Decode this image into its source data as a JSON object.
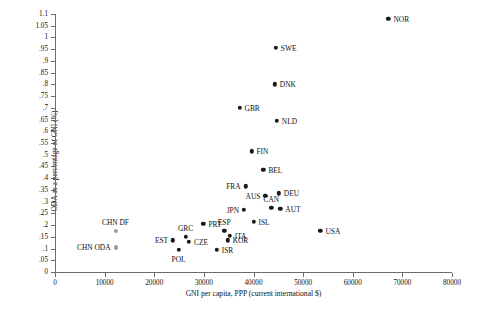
{
  "chart_data": {
    "type": "scatter",
    "title": "",
    "xlabel": "GNI per capita, PPP (current international $)",
    "ylabel": "ODA as a percentage of GNI (%)",
    "xlim": [
      0,
      80000
    ],
    "ylim": [
      0,
      1.1
    ],
    "grid": false,
    "legend": "none",
    "xticks": [
      "0",
      "10000",
      "20000",
      "30000",
      "40000",
      "50000",
      "60000",
      "70000",
      "80000"
    ],
    "xtick_values": [
      0,
      10000,
      20000,
      30000,
      40000,
      50000,
      60000,
      70000,
      80000
    ],
    "yticks": [
      "0",
      ".05",
      ".1",
      ".15",
      ".2",
      ".25",
      ".3",
      ".35",
      ".4",
      ".45",
      ".5",
      ".55",
      ".6",
      ".65",
      ".7",
      ".75",
      ".8",
      ".85",
      ".9",
      ".95",
      "1",
      "1.05",
      "1.1"
    ],
    "ytick_values": [
      0,
      0.05,
      0.1,
      0.15,
      0.2,
      0.25,
      0.3,
      0.35,
      0.4,
      0.45,
      0.5,
      0.55,
      0.6,
      0.65,
      0.7,
      0.75,
      0.8,
      0.85,
      0.9,
      0.95,
      1.0,
      1.05,
      1.1
    ],
    "point_color": "#1a1a1a",
    "secondary_point_color": "#9a9a9a",
    "points": [
      {
        "label": "NOR",
        "x": 67200,
        "y": 1.08,
        "pos": "r",
        "style": "dark"
      },
      {
        "label": "SWE",
        "x": 44500,
        "y": 0.955,
        "pos": "r",
        "style": "dark"
      },
      {
        "label": "DNK",
        "x": 44300,
        "y": 0.8,
        "pos": "r",
        "style": "dark"
      },
      {
        "label": "GBR",
        "x": 37200,
        "y": 0.7,
        "pos": "r",
        "style": "dark"
      },
      {
        "label": "NLD",
        "x": 44700,
        "y": 0.645,
        "pos": "r",
        "style": "dark"
      },
      {
        "label": "FIN",
        "x": 39600,
        "y": 0.515,
        "pos": "r",
        "style": "dark"
      },
      {
        "label": "BEL",
        "x": 42000,
        "y": 0.435,
        "pos": "r",
        "style": "dark"
      },
      {
        "label": "FRA",
        "x": 38400,
        "y": 0.365,
        "pos": "l",
        "style": "dark"
      },
      {
        "label": "DEU",
        "x": 45100,
        "y": 0.335,
        "pos": "r",
        "style": "dark"
      },
      {
        "label": "AUS",
        "x": 42400,
        "y": 0.325,
        "pos": "l",
        "style": "dark"
      },
      {
        "label": "CAN",
        "x": 43600,
        "y": 0.275,
        "pos": "t",
        "style": "dark"
      },
      {
        "label": "AUT",
        "x": 45400,
        "y": 0.27,
        "pos": "r",
        "style": "dark"
      },
      {
        "label": "JPN",
        "x": 38100,
        "y": 0.265,
        "pos": "l",
        "style": "dark"
      },
      {
        "label": "ISL",
        "x": 40000,
        "y": 0.215,
        "pos": "r",
        "style": "dark"
      },
      {
        "label": "USA",
        "x": 53500,
        "y": 0.175,
        "pos": "r",
        "style": "dark"
      },
      {
        "label": "PRT",
        "x": 29900,
        "y": 0.205,
        "pos": "r",
        "style": "dark"
      },
      {
        "label": "ESP",
        "x": 34100,
        "y": 0.175,
        "pos": "t",
        "style": "dark"
      },
      {
        "label": "ITA",
        "x": 35200,
        "y": 0.155,
        "pos": "r",
        "style": "dark"
      },
      {
        "label": "KOR",
        "x": 34800,
        "y": 0.135,
        "pos": "r",
        "style": "dark"
      },
      {
        "label": "GRC",
        "x": 26300,
        "y": 0.15,
        "pos": "t",
        "style": "dark"
      },
      {
        "label": "CZE",
        "x": 27000,
        "y": 0.13,
        "pos": "r",
        "style": "dark"
      },
      {
        "label": "EST",
        "x": 23800,
        "y": 0.135,
        "pos": "l",
        "style": "dark"
      },
      {
        "label": "POL",
        "x": 24900,
        "y": 0.095,
        "pos": "b",
        "style": "dark"
      },
      {
        "label": "ISR",
        "x": 32600,
        "y": 0.095,
        "pos": "r",
        "style": "dark"
      },
      {
        "label": "CHN DF",
        "x": 12200,
        "y": 0.175,
        "pos": "t",
        "style": "gray"
      },
      {
        "label": "CHN ODA",
        "x": 12200,
        "y": 0.105,
        "pos": "l",
        "style": "gray"
      }
    ]
  }
}
